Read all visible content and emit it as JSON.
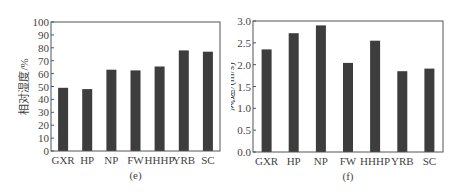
{
  "chart_data": [
    {
      "type": "bar",
      "panel_label": "(e)",
      "title": "",
      "xlabel": "",
      "ylabel": "相对湿度/%",
      "categories": [
        "GXR",
        "HP",
        "NP",
        "FW",
        "HHHP",
        "YRB",
        "SC"
      ],
      "values": [
        49,
        48,
        63,
        62.5,
        65.5,
        78,
        77
      ],
      "ylim": [
        0,
        100
      ],
      "yticks": [
        0,
        10,
        20,
        30,
        40,
        50,
        60,
        70,
        80,
        90,
        100
      ],
      "ytick_labels": [
        "0",
        "10",
        "20",
        "30",
        "40",
        "50",
        "60",
        "70",
        "80",
        "90",
        "100"
      ],
      "grid": false,
      "legend": null,
      "bar_color": "#3d3d3d"
    },
    {
      "type": "bar",
      "panel_label": "(f)",
      "title": "",
      "xlabel": "",
      "ylabel": "风速/(m/s)",
      "categories": [
        "GXR",
        "HP",
        "NP",
        "FW",
        "HHHP",
        "YRB",
        "SC"
      ],
      "values": [
        2.35,
        2.72,
        2.9,
        2.04,
        2.55,
        1.85,
        1.91
      ],
      "ylim": [
        0,
        3.0
      ],
      "yticks": [
        0,
        0.5,
        1.0,
        1.5,
        2.0,
        2.5,
        3.0
      ],
      "ytick_labels": [
        "0.0",
        "0.5",
        "1.0",
        "1.5",
        "2.0",
        "2.5",
        "3.0"
      ],
      "grid": false,
      "legend": null,
      "bar_color": "#3d3d3d"
    }
  ]
}
